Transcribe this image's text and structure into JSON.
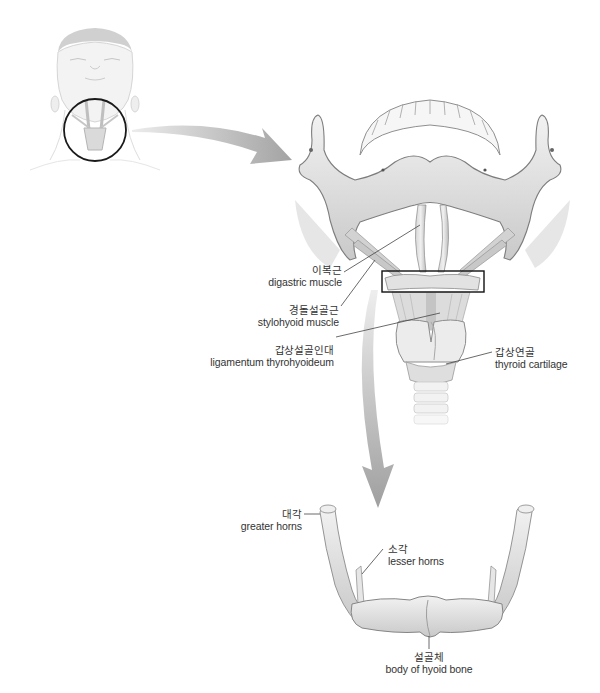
{
  "figure": {
    "colors": {
      "background": "#ffffff",
      "bone": "#e4e4e4",
      "bone_shadow": "#b5b5b5",
      "outline": "#8a8a8a",
      "arrow": "#a9a9a9",
      "highlight_box": "#111111",
      "leader_line": "#444444",
      "text": "#333333"
    }
  },
  "panels": {
    "head": {
      "name": "head-overview",
      "highlight": "circle around neck"
    },
    "jaw": {
      "name": "mandible-larynx-view",
      "highlight": "rectangle around hyoid"
    },
    "hyoid": {
      "name": "isolated-hyoid-view"
    }
  },
  "labels": {
    "digastric": {
      "ko": "이복근",
      "en": "digastric muscle"
    },
    "stylohyoid": {
      "ko": "경돌설골근",
      "en": "stylohyoid muscle"
    },
    "thyrohyoid_ligament": {
      "ko": "갑상설골인대",
      "en": "ligamentum thyrohyoideum"
    },
    "thyroid_cartilage": {
      "ko": "갑상연골",
      "en": "thyroid cartilage"
    },
    "greater_horns": {
      "ko": "대각",
      "en": "greater horns"
    },
    "lesser_horns": {
      "ko": "소각",
      "en": "lesser horns"
    },
    "hyoid_body": {
      "ko": "설골체",
      "en": "body of hyoid bone"
    }
  },
  "arrows": [
    {
      "name": "head-to-jaw-arrow",
      "direction": "right"
    },
    {
      "name": "jaw-to-hyoid-arrow",
      "direction": "down"
    }
  ]
}
